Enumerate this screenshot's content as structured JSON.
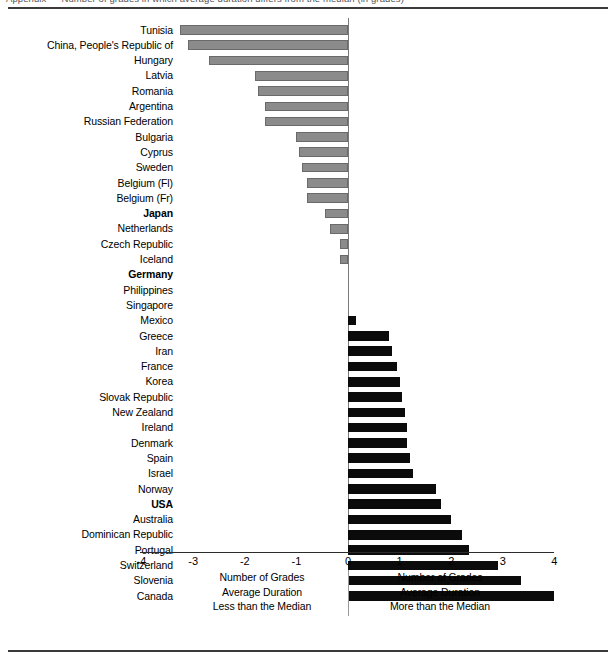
{
  "top_clipped_text": "Appendix — Number of grades in which average duration differs from the median (in grades)",
  "chart_data": {
    "type": "bar",
    "orientation": "horizontal-diverging",
    "title": "",
    "xlabel": "",
    "ylabel": "",
    "xlim": [
      -4,
      4
    ],
    "xticks": [
      "-4",
      "-3",
      "-2",
      "-1",
      "0",
      "1",
      "2",
      "3",
      "4"
    ],
    "xtick_values": [
      -4,
      -3,
      -2,
      -1,
      0,
      1,
      2,
      3,
      4
    ],
    "grid": false,
    "legend_position": "below-axis",
    "colors": {
      "negative_bar": "#8b8b8b",
      "negative_bar_border": "#6a6a6a",
      "positive_bar": "#0b0b0b",
      "axis": "#2b2b2b",
      "text": "#000000"
    },
    "categories": [
      "Tunisia",
      "China, People's Republic of",
      "Hungary",
      "Latvia",
      "Romania",
      "Argentina",
      "Russian Federation",
      "Bulgaria",
      "Cyprus",
      "Sweden",
      "Belgium (Fl)",
      "Belgium (Fr)",
      "Japan",
      "Netherlands",
      "Czech Republic",
      "Iceland",
      "Germany",
      "Philippines",
      "Singapore",
      "Mexico",
      "Greece",
      "Iran",
      "France",
      "Korea",
      "Slovak Republic",
      "New Zealand",
      "Ireland",
      "Denmark",
      "Spain",
      "Israel",
      "Norway",
      "USA",
      "Australia",
      "Dominican Republic",
      "Portugal",
      "Switzerland",
      "Slovenia",
      "Canada"
    ],
    "values": [
      -3.25,
      -3.1,
      -2.7,
      -1.8,
      -1.75,
      -1.6,
      -1.6,
      -1.0,
      -0.95,
      -0.9,
      -0.8,
      -0.8,
      -0.45,
      -0.35,
      -0.15,
      -0.15,
      0.0,
      0.0,
      0.0,
      0.15,
      0.8,
      0.85,
      0.95,
      1.0,
      1.05,
      1.1,
      1.15,
      1.15,
      1.2,
      1.25,
      1.7,
      1.8,
      2.0,
      2.2,
      2.35,
      2.9,
      3.35,
      4.0
    ],
    "emphasized_categories": [
      "Japan",
      "Germany",
      "USA"
    ],
    "legend": {
      "left": [
        "Number of Grades",
        "Average Duration",
        "Less than the Median"
      ],
      "right": [
        "Number of Grades",
        "Average Duration",
        "More than the Median"
      ]
    }
  }
}
